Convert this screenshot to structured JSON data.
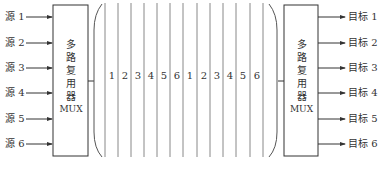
{
  "diagram": {
    "sources": [
      "源 1",
      "源 2",
      "源 3",
      "源 4",
      "源 5",
      "源 6"
    ],
    "targets": [
      "目标 1",
      "目标 2",
      "目标 3",
      "目标 4",
      "目标 5",
      "目标 6"
    ],
    "mux_left": {
      "chars": [
        "多",
        "路",
        "复",
        "用",
        "器"
      ],
      "abbr": "MUX"
    },
    "mux_right": {
      "chars": [
        "多",
        "路",
        "复",
        "用",
        "器"
      ],
      "abbr": "MUX"
    },
    "time_slots": [
      "1",
      "2",
      "3",
      "4",
      "5",
      "6",
      "1",
      "2",
      "3",
      "4",
      "5",
      "6"
    ],
    "colors": {
      "line": "#333333",
      "slot_line": "#888888"
    }
  }
}
